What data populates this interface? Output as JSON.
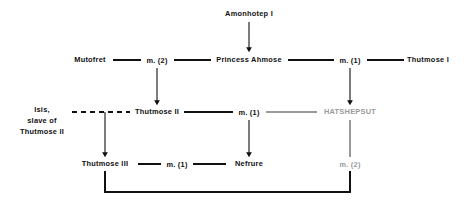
{
  "diagram": {
    "type": "genealogy-chart",
    "colors": {
      "ink": "#111111",
      "muted": "#9a9a9a",
      "background": "#ffffff"
    },
    "nodes": [
      {
        "id": "amonhotep-i",
        "label": "Amonhotep I",
        "x": 249,
        "y": 14,
        "style": "normal"
      },
      {
        "id": "mutofret",
        "label": "Mutofret",
        "x": 90,
        "y": 60,
        "style": "normal"
      },
      {
        "id": "princess-ahmose",
        "label": "Princess Ahmose",
        "x": 249,
        "y": 60,
        "style": "normal"
      },
      {
        "id": "thutmose-i",
        "label": "Thutmose I",
        "x": 428,
        "y": 60,
        "style": "normal"
      },
      {
        "id": "isis",
        "label": "Isis,\nslave of\nThutmose II",
        "x": 42,
        "y": 120,
        "style": "normal"
      },
      {
        "id": "thutmose-ii",
        "label": "Thutmose II",
        "x": 157,
        "y": 112,
        "style": "normal"
      },
      {
        "id": "hatshepsut",
        "label": "HATSHEPSUT",
        "x": 350,
        "y": 112,
        "style": "muted"
      },
      {
        "id": "thutmose-iii",
        "label": "Thutmose III",
        "x": 105,
        "y": 164,
        "style": "normal"
      },
      {
        "id": "nefrure",
        "label": "Nefrure",
        "x": 249,
        "y": 164,
        "style": "normal"
      }
    ],
    "marriages": [
      {
        "id": "m2-mutofret-ahmose",
        "label": "m. (2)",
        "x": 157,
        "y": 60,
        "style": "normal"
      },
      {
        "id": "m1-ahmose-thutmose-i",
        "label": "m. (1)",
        "x": 350,
        "y": 60,
        "style": "normal"
      },
      {
        "id": "m1-thutmose-ii-hat",
        "label": "m. (1)",
        "x": 249,
        "y": 112,
        "style": "normal"
      },
      {
        "id": "m1-thutmose-iii-nef",
        "label": "m. (1)",
        "x": 177,
        "y": 164,
        "style": "normal"
      },
      {
        "id": "m2-hatshepsut-line",
        "label": "m. (2)",
        "x": 350,
        "y": 164,
        "style": "muted"
      }
    ],
    "relations": [
      {
        "id": "mutofret-to-m2",
        "kind": "marriage-line"
      },
      {
        "id": "m2-to-ahmose",
        "kind": "marriage-line"
      },
      {
        "id": "ahmose-to-m1",
        "kind": "marriage-line"
      },
      {
        "id": "m1-to-thutmose-i",
        "kind": "marriage-line"
      },
      {
        "id": "isis-to-thutmose-ii",
        "kind": "dashed-union"
      },
      {
        "id": "thutmose-ii-to-m1",
        "kind": "marriage-line"
      },
      {
        "id": "m1-to-hatshepsut",
        "kind": "marriage-line"
      },
      {
        "id": "thutmose-iii-to-m1",
        "kind": "marriage-line"
      },
      {
        "id": "m1-to-nefrure",
        "kind": "marriage-line"
      },
      {
        "id": "amonhotep-descent",
        "kind": "descent-arrow"
      },
      {
        "id": "m2-descent",
        "kind": "descent-arrow"
      },
      {
        "id": "m1-right-descent",
        "kind": "descent-arrow"
      },
      {
        "id": "union-descent",
        "kind": "descent-arrow"
      },
      {
        "id": "m1-mid-descent",
        "kind": "descent-arrow"
      },
      {
        "id": "thutmose-iii-loop",
        "kind": "union-bracket"
      }
    ]
  }
}
